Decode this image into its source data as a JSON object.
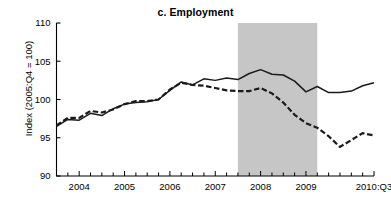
{
  "chart_data": {
    "type": "line",
    "title": "c. Employment",
    "xlabel": "",
    "ylabel": "Index (2005:Q4 = 100)",
    "ylim": [
      90,
      110
    ],
    "yticks": [
      90,
      95,
      100,
      105,
      110
    ],
    "ytick_labels": [
      "90",
      "95",
      "100",
      "105",
      "110"
    ],
    "xlim": [
      "2003:Q3",
      "2010:Q3"
    ],
    "xtick_labels": [
      "2004",
      "2005",
      "2006",
      "2007",
      "2008",
      "2009",
      "2010:Q3"
    ],
    "xtick_positions": [
      "2004:Q1",
      "2005:Q1",
      "2006:Q1",
      "2007:Q1",
      "2008:Q1",
      "2009:Q1",
      "2010:Q3"
    ],
    "minor_ticks": "quarterly",
    "grid": false,
    "legend": "none",
    "x": [
      "2003:Q3",
      "2003:Q4",
      "2004:Q1",
      "2004:Q2",
      "2004:Q3",
      "2004:Q4",
      "2005:Q1",
      "2005:Q2",
      "2005:Q3",
      "2005:Q4",
      "2006:Q1",
      "2006:Q2",
      "2006:Q3",
      "2006:Q4",
      "2007:Q1",
      "2007:Q2",
      "2007:Q3",
      "2007:Q4",
      "2008:Q1",
      "2008:Q2",
      "2008:Q3",
      "2008:Q4",
      "2009:Q1",
      "2009:Q2",
      "2009:Q3",
      "2009:Q4",
      "2010:Q1",
      "2010:Q2",
      "2010:Q3"
    ],
    "series": [
      {
        "name": "solid-series",
        "style": "solid",
        "color": "#1a1a1a",
        "values": [
          96.5,
          97.4,
          97.3,
          98.2,
          97.9,
          98.8,
          99.4,
          99.6,
          99.7,
          100.0,
          101.2,
          102.3,
          101.9,
          102.7,
          102.5,
          102.8,
          102.6,
          103.4,
          103.9,
          103.3,
          103.2,
          102.4,
          101.0,
          101.7,
          100.9,
          100.9,
          101.1,
          101.8,
          102.2
        ]
      },
      {
        "name": "dashed-series",
        "style": "dashed",
        "color": "#1a1a1a",
        "values": [
          96.6,
          97.6,
          97.6,
          98.5,
          98.3,
          98.7,
          99.4,
          99.8,
          99.8,
          100.0,
          101.3,
          102.2,
          101.9,
          101.8,
          101.5,
          101.2,
          101.1,
          101.1,
          101.5,
          100.8,
          99.6,
          98.0,
          96.9,
          96.3,
          95.2,
          93.8,
          94.7,
          95.6,
          95.3
        ]
      }
    ],
    "shaded_region": {
      "name": "recession-band",
      "start": "2007:Q3",
      "end": "2009:Q2",
      "color": "#c6c6c6"
    }
  }
}
